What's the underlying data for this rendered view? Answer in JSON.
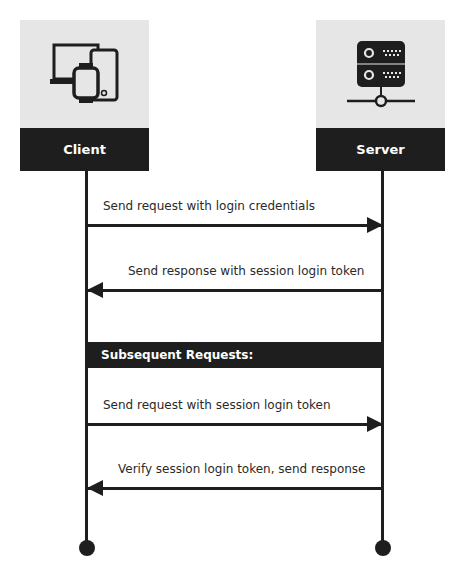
{
  "actors": {
    "client": {
      "label": "Client",
      "icon": "devices-icon"
    },
    "server": {
      "label": "Server",
      "icon": "server-icon"
    }
  },
  "messages": [
    {
      "text": "Send request with login credentials",
      "direction": "client-to-server"
    },
    {
      "text": "Send response with session login token",
      "direction": "server-to-client"
    },
    {
      "text": "Send request with session login token",
      "direction": "client-to-server"
    },
    {
      "text": "Verify session login token, send response",
      "direction": "server-to-client"
    }
  ],
  "section": {
    "label": "Subsequent Requests:"
  },
  "colors": {
    "dark": "#1e1e1e",
    "icon_bg": "#e6e6e6",
    "background": "#ffffff"
  }
}
